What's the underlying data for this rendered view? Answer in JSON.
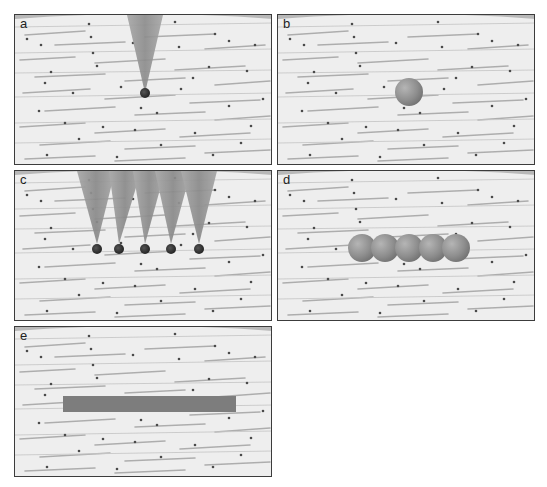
{
  "figure": {
    "panels": [
      {
        "id": "a",
        "label": "a",
        "description": "single needle injecting one droplet into fibrous tissue",
        "needles": 1,
        "depots": "single small dark droplet at needle tip"
      },
      {
        "id": "b",
        "label": "b",
        "description": "single spherical depot in tissue",
        "depots": "one sphere"
      },
      {
        "id": "c",
        "label": "c",
        "description": "five needles each injecting a droplet in a row",
        "needles": 5,
        "depots": "five small dark droplets"
      },
      {
        "id": "d",
        "label": "d",
        "description": "five overlapping spherical depots forming a chain",
        "depots": "five spheres"
      },
      {
        "id": "e",
        "label": "e",
        "description": "continuous rod-shaped depot lying along tissue fibers",
        "depots": "one elongated bar"
      }
    ],
    "colors": {
      "tissue_background": "#ededed",
      "fiber_streak": "#9a9a9a",
      "dot": "#4a4a4a",
      "needle": "#8c8c8c",
      "droplet": "#2b2b2b",
      "sphere": "#8f8f8f",
      "rod": "#7d7d7d",
      "border": "#3c3c3c",
      "top_band": "#b8b8b8"
    }
  }
}
